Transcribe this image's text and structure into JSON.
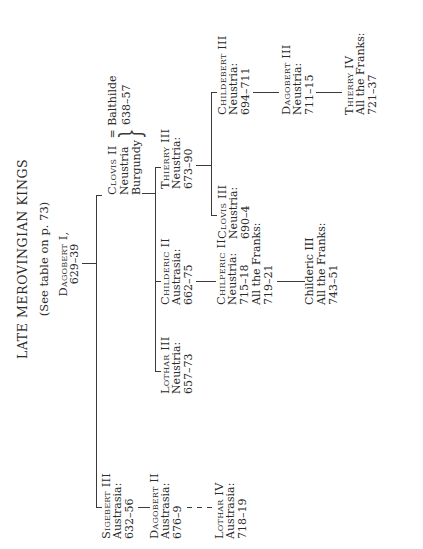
{
  "title": "LATE MEROVINGIAN KINGS",
  "subtitle": "(See table on p. 73)",
  "root": {
    "name": "Dagobert I,",
    "dates": "629–39"
  },
  "people": {
    "sigebert3": {
      "name": "Sigebert III",
      "line2": "Austrasia:",
      "line3": "632–56"
    },
    "clovis2": {
      "name": "Clovis II",
      "spouse": "= Balthilde",
      "line2": "Neustria",
      "line3": "Burgundy",
      "dates": "638–57"
    },
    "dagobert2": {
      "name": "Dagobert II",
      "line2": "Austrasia:",
      "line3": "676–9"
    },
    "lothar4": {
      "name": "Lothar IV",
      "line2": "Austrasia:",
      "line3": "718–19"
    },
    "lothar3": {
      "name": "Lothar III",
      "line2": "Neustria:",
      "line3": "657–73"
    },
    "childeric2": {
      "name": "Childeric II",
      "line2": "Austrasia:",
      "line3": "662–75"
    },
    "thierry3": {
      "name": "Thierry III",
      "line2": "Neustria:",
      "line3": "673–90"
    },
    "chilperic2": {
      "name": "Chilperic II",
      "line2": "Neustria:",
      "line3": "715–18",
      "line4": "All the Franks:",
      "line5": "719–21"
    },
    "childeric3": {
      "name": "Childeric III",
      "line2": "All the Franks:",
      "line3": "743–51"
    },
    "clovis3": {
      "name": "Clovis III",
      "line2": "Neustria:",
      "line3": "690–4"
    },
    "childebert3": {
      "name": "Childebert III",
      "line2": "Neustria:",
      "line3": "694–711"
    },
    "dagobert3": {
      "name": "Dagobert III",
      "line2": "Neustria:",
      "line3": "711–15"
    },
    "thierry4": {
      "name": "Thierry IV",
      "line2": "All the Franks:",
      "line3": "721–37"
    }
  },
  "colors": {
    "ink": "#2a2a2a",
    "lines": "#3a3a3a",
    "paper": "#ffffff"
  }
}
